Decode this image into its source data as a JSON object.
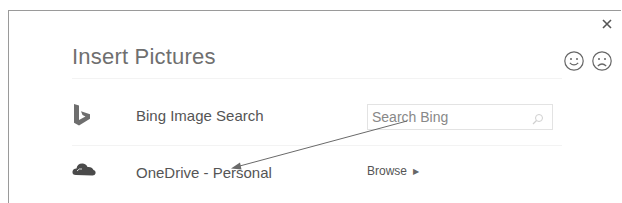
{
  "dialog": {
    "title": "Insert Pictures",
    "close_icon": "close-icon",
    "feedback": [
      {
        "name": "smile-icon",
        "label": "Send a smile"
      },
      {
        "name": "frown-icon",
        "label": "Send a frown"
      }
    ]
  },
  "sources": [
    {
      "icon": "bing-logo-icon",
      "label": "Bing Image Search",
      "action": {
        "type": "search",
        "placeholder": "Search Bing",
        "value": "",
        "icon": "search-icon"
      }
    },
    {
      "icon": "onedrive-cloud-icon",
      "label": "OneDrive - Personal",
      "action": {
        "type": "browse",
        "label": "Browse",
        "icon": "caret-right-icon",
        "caret": "▶"
      }
    }
  ],
  "annotation": {
    "type": "arrow",
    "from": [
      407,
      121
    ],
    "to": [
      232,
      168
    ],
    "color": "#6a6a6a"
  },
  "colors": {
    "title": "#6f6f6f",
    "text": "#555555",
    "border": "#9a9a9a",
    "bing_icon": "#6e6e6e",
    "onedrive_icon": "#4a4a4a"
  }
}
